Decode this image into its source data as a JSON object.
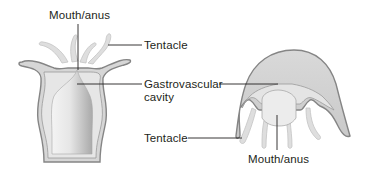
{
  "diagram": {
    "type": "labeled-biology-illustration",
    "subjects": [
      "polyp",
      "medusa"
    ],
    "colors": {
      "background": "#ffffff",
      "body_outline": "#8a8a8a",
      "body_fill": "#d4d4d4",
      "inner_fill": "#e8e8e8",
      "cavity_light": "#f2f2f2",
      "cavity_dark": "#b8b8b8",
      "tentacle_fill": "#dcdcdc",
      "leader_line": "#231f20",
      "text": "#231f20"
    },
    "labels": {
      "polyp_mouth": "Mouth/anus",
      "tentacle_top": "Tentacle",
      "gastro_line1": "Gastrovascular",
      "gastro_line2": "cavity",
      "tentacle_bottom": "Tentacle",
      "medusa_mouth": "Mouth/anus"
    }
  }
}
